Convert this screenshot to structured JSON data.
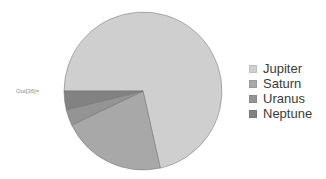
{
  "output_label": "Out[36]=",
  "chart_data": {
    "type": "pie",
    "title": "",
    "categories": [
      "Jupiter",
      "Saturn",
      "Uranus",
      "Neptune"
    ],
    "values": [
      1898,
      568,
      86.8,
      102
    ],
    "percentages": [
      71.5,
      21.4,
      3.3,
      3.8
    ],
    "colors": [
      "#cfcfcf",
      "#a8a8a8",
      "#949494",
      "#828282"
    ],
    "start_angle_deg": 180,
    "direction": "clockwise",
    "legend_position": "right"
  },
  "legend": {
    "items": [
      {
        "label": "Jupiter",
        "color": "#cfcfcf"
      },
      {
        "label": "Saturn",
        "color": "#a8a8a8"
      },
      {
        "label": "Uranus",
        "color": "#949494"
      },
      {
        "label": "Neptune",
        "color": "#828282"
      }
    ]
  }
}
